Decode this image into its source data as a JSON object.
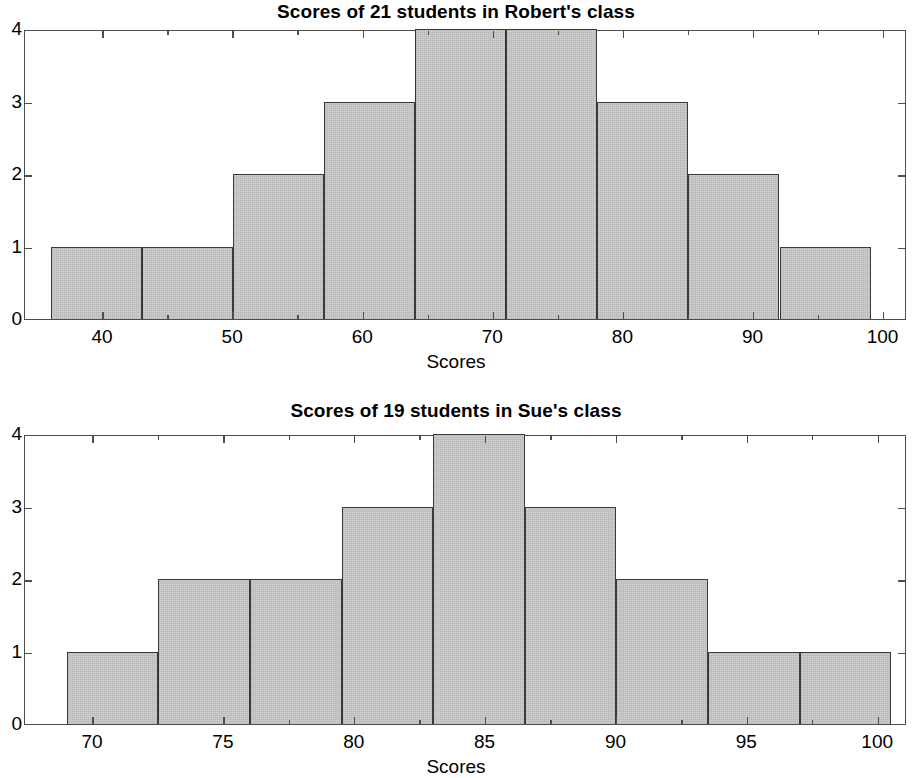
{
  "figure": {
    "background_color": "#ffffff",
    "axis_color": "#4d4d4d",
    "bar_fill_color": "#c9c9c9",
    "bar_edge_color": "#3a3a3a"
  },
  "charts": [
    {
      "id": "robert",
      "title": "Scores of 21 students in Robert's class",
      "xlabel": "Scores",
      "ylabel": "",
      "xticklabels": [
        "40",
        "50",
        "60",
        "70",
        "80",
        "90",
        "100"
      ],
      "xtickvalues": [
        40,
        50,
        60,
        70,
        80,
        90,
        100
      ],
      "yticklabels": [
        "0",
        "1",
        "2",
        "3",
        "4"
      ],
      "ytickvalues": [
        0,
        1,
        2,
        3,
        4
      ]
    },
    {
      "id": "sue",
      "title": "Scores of 19 students in Sue's class",
      "xlabel": "Scores",
      "ylabel": "",
      "xticklabels": [
        "70",
        "75",
        "80",
        "85",
        "90",
        "95",
        "100"
      ],
      "xtickvalues": [
        70,
        75,
        80,
        85,
        90,
        95,
        100
      ],
      "yticklabels": [
        "0",
        "1",
        "2",
        "3",
        "4"
      ],
      "ytickvalues": [
        0,
        1,
        2,
        3,
        4
      ]
    }
  ],
  "chart_data": [
    {
      "type": "bar",
      "title": "Scores of 21 students in Robert's class",
      "xlabel": "Scores",
      "ylabel": "",
      "categories": [
        "36-43",
        "43-50",
        "50-57",
        "57-64",
        "64-71",
        "71-78",
        "78-85",
        "85-92",
        "92-99"
      ],
      "bin_edges": [
        36,
        43,
        50,
        57,
        64,
        71,
        78,
        85,
        92,
        99
      ],
      "values": [
        1,
        1,
        2,
        3,
        4,
        4,
        3,
        2,
        1
      ],
      "total_count": 21,
      "xlim": [
        34,
        101.8
      ],
      "ylim": [
        0,
        4
      ],
      "xticks": [
        40,
        50,
        60,
        70,
        80,
        90,
        100
      ],
      "yticks": [
        0,
        1,
        2,
        3,
        4
      ],
      "grid": false,
      "legend": null
    },
    {
      "type": "bar",
      "title": "Scores of 19 students in Sue's class",
      "xlabel": "Scores",
      "ylabel": "",
      "categories": [
        "69.0-72.5",
        "72.5-76.0",
        "76.0-79.5",
        "79.5-83.0",
        "83.0-86.5",
        "86.5-90.0",
        "90.0-93.5",
        "93.5-97.0",
        "97.0-100.5"
      ],
      "bin_edges": [
        69.0,
        72.5,
        76.0,
        79.5,
        83.0,
        86.5,
        90.0,
        93.5,
        97.0,
        100.5
      ],
      "values": [
        1,
        2,
        2,
        3,
        4,
        3,
        2,
        1,
        1
      ],
      "total_count": 19,
      "xlim": [
        67.4,
        101.1
      ],
      "ylim": [
        0,
        4
      ],
      "xticks": [
        70,
        75,
        80,
        85,
        90,
        95,
        100
      ],
      "yticks": [
        0,
        1,
        2,
        3,
        4
      ],
      "grid": false,
      "legend": null
    }
  ]
}
